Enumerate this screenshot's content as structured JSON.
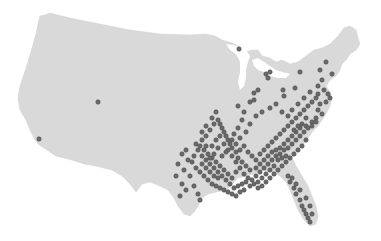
{
  "map": {
    "region": "Contiguous United States",
    "land_color": "#d9d9d9",
    "point_color": "#6a6a6a",
    "point_stroke": "#4d4d4d",
    "background": "#ffffff"
  },
  "points": [
    [
      98,
      102
    ],
    [
      39,
      139
    ],
    [
      239,
      49
    ],
    [
      266,
      74
    ],
    [
      268,
      78
    ],
    [
      270,
      72
    ],
    [
      254,
      93
    ],
    [
      254,
      100
    ],
    [
      258,
      90
    ],
    [
      283,
      90
    ],
    [
      295,
      88
    ],
    [
      284,
      96
    ],
    [
      300,
      72
    ],
    [
      320,
      70
    ],
    [
      332,
      74
    ],
    [
      326,
      62
    ],
    [
      322,
      80
    ],
    [
      318,
      86
    ],
    [
      324,
      90
    ],
    [
      328,
      94
    ],
    [
      330,
      98
    ],
    [
      326,
      102
    ],
    [
      320,
      104
    ],
    [
      318,
      110
    ],
    [
      322,
      114
    ],
    [
      316,
      118
    ],
    [
      312,
      122
    ],
    [
      306,
      126
    ],
    [
      300,
      128
    ],
    [
      296,
      132
    ],
    [
      292,
      136
    ],
    [
      288,
      140
    ],
    [
      284,
      144
    ],
    [
      280,
      148
    ],
    [
      276,
      150
    ],
    [
      272,
      152
    ],
    [
      268,
      156
    ],
    [
      264,
      160
    ],
    [
      260,
      164
    ],
    [
      256,
      168
    ],
    [
      250,
      170
    ],
    [
      246,
      166
    ],
    [
      242,
      162
    ],
    [
      238,
      158
    ],
    [
      236,
      152
    ],
    [
      232,
      148
    ],
    [
      230,
      144
    ],
    [
      228,
      140
    ],
    [
      226,
      136
    ],
    [
      224,
      132
    ],
    [
      222,
      128
    ],
    [
      220,
      124
    ],
    [
      218,
      120
    ],
    [
      214,
      124
    ],
    [
      210,
      130
    ],
    [
      206,
      136
    ],
    [
      202,
      140
    ],
    [
      200,
      146
    ],
    [
      204,
      150
    ],
    [
      208,
      154
    ],
    [
      212,
      158
    ],
    [
      216,
      162
    ],
    [
      220,
      166
    ],
    [
      224,
      170
    ],
    [
      228,
      174
    ],
    [
      232,
      178
    ],
    [
      236,
      172
    ],
    [
      240,
      168
    ],
    [
      244,
      174
    ],
    [
      248,
      178
    ],
    [
      252,
      180
    ],
    [
      256,
      176
    ],
    [
      260,
      172
    ],
    [
      264,
      168
    ],
    [
      268,
      164
    ],
    [
      272,
      160
    ],
    [
      276,
      156
    ],
    [
      280,
      154
    ],
    [
      284,
      150
    ],
    [
      288,
      148
    ],
    [
      292,
      144
    ],
    [
      296,
      140
    ],
    [
      300,
      136
    ],
    [
      304,
      132
    ],
    [
      308,
      128
    ],
    [
      312,
      126
    ],
    [
      316,
      122
    ],
    [
      306,
      140
    ],
    [
      302,
      146
    ],
    [
      298,
      150
    ],
    [
      294,
      154
    ],
    [
      290,
      158
    ],
    [
      286,
      162
    ],
    [
      282,
      166
    ],
    [
      278,
      170
    ],
    [
      274,
      174
    ],
    [
      270,
      178
    ],
    [
      266,
      182
    ],
    [
      262,
      186
    ],
    [
      258,
      188
    ],
    [
      254,
      184
    ],
    [
      250,
      186
    ],
    [
      246,
      182
    ],
    [
      242,
      184
    ],
    [
      238,
      186
    ],
    [
      234,
      188
    ],
    [
      230,
      184
    ],
    [
      226,
      180
    ],
    [
      222,
      176
    ],
    [
      218,
      172
    ],
    [
      214,
      168
    ],
    [
      210,
      164
    ],
    [
      206,
      160
    ],
    [
      202,
      156
    ],
    [
      198,
      150
    ],
    [
      196,
      144
    ],
    [
      194,
      156
    ],
    [
      192,
      162
    ],
    [
      196,
      168
    ],
    [
      200,
      172
    ],
    [
      204,
      176
    ],
    [
      208,
      180
    ],
    [
      212,
      184
    ],
    [
      216,
      186
    ],
    [
      220,
      188
    ],
    [
      224,
      190
    ],
    [
      228,
      192
    ],
    [
      232,
      194
    ],
    [
      212,
      146
    ],
    [
      216,
      140
    ],
    [
      220,
      136
    ],
    [
      224,
      144
    ],
    [
      228,
      150
    ],
    [
      232,
      156
    ],
    [
      236,
      162
    ],
    [
      240,
      150
    ],
    [
      244,
      146
    ],
    [
      248,
      152
    ],
    [
      252,
      156
    ],
    [
      256,
      160
    ],
    [
      260,
      154
    ],
    [
      264,
      150
    ],
    [
      268,
      146
    ],
    [
      272,
      142
    ],
    [
      276,
      138
    ],
    [
      280,
      134
    ],
    [
      284,
      130
    ],
    [
      288,
      126
    ],
    [
      292,
      122
    ],
    [
      296,
      118
    ],
    [
      300,
      114
    ],
    [
      304,
      110
    ],
    [
      308,
      106
    ],
    [
      312,
      102
    ],
    [
      316,
      98
    ],
    [
      318,
      94
    ],
    [
      306,
      118
    ],
    [
      302,
      124
    ],
    [
      298,
      126
    ],
    [
      294,
      130
    ],
    [
      278,
      160
    ],
    [
      282,
      158
    ],
    [
      286,
      156
    ],
    [
      274,
      166
    ],
    [
      270,
      170
    ],
    [
      266,
      174
    ],
    [
      262,
      178
    ],
    [
      258,
      182
    ],
    [
      244,
      190
    ],
    [
      240,
      192
    ],
    [
      236,
      196
    ],
    [
      218,
      178
    ],
    [
      214,
      176
    ],
    [
      210,
      172
    ],
    [
      206,
      168
    ],
    [
      202,
      164
    ],
    [
      288,
      176
    ],
    [
      290,
      182
    ],
    [
      294,
      188
    ],
    [
      296,
      194
    ],
    [
      300,
      200
    ],
    [
      302,
      206
    ],
    [
      304,
      210
    ],
    [
      306,
      214
    ],
    [
      308,
      218
    ],
    [
      310,
      222
    ],
    [
      312,
      214
    ],
    [
      310,
      206
    ],
    [
      306,
      198
    ],
    [
      300,
      190
    ],
    [
      296,
      184
    ],
    [
      292,
      178
    ],
    [
      186,
      150
    ],
    [
      188,
      160
    ],
    [
      184,
      170
    ],
    [
      190,
      176
    ],
    [
      194,
      186
    ],
    [
      198,
      194
    ],
    [
      200,
      200
    ],
    [
      186,
      190
    ],
    [
      180,
      196
    ],
    [
      182,
      184
    ],
    [
      176,
      176
    ],
    [
      178,
      164
    ],
    [
      182,
      154
    ],
    [
      242,
      120
    ],
    [
      238,
      128
    ],
    [
      234,
      134
    ],
    [
      240,
      138
    ],
    [
      246,
      132
    ],
    [
      250,
      124
    ],
    [
      256,
      116
    ],
    [
      262,
      112
    ],
    [
      270,
      108
    ],
    [
      276,
      104
    ],
    [
      282,
      112
    ],
    [
      288,
      116
    ],
    [
      292,
      110
    ],
    [
      298,
      104
    ],
    [
      304,
      98
    ],
    [
      310,
      92
    ],
    [
      238,
      106
    ],
    [
      244,
      112
    ],
    [
      250,
      102
    ],
    [
      232,
      140
    ],
    [
      236,
      144
    ],
    [
      226,
      152
    ],
    [
      222,
      156
    ],
    [
      218,
      148
    ],
    [
      214,
      154
    ],
    [
      210,
      158
    ],
    [
      206,
      146
    ],
    [
      202,
      132
    ],
    [
      206,
      126
    ],
    [
      212,
      118
    ],
    [
      216,
      112
    ]
  ]
}
